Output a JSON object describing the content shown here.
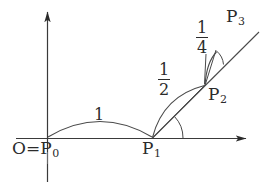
{
  "figure": {
    "type": "geometric-diagram",
    "background_color": "#ffffff",
    "stroke_color": "#2b2b2b",
    "width": 267,
    "height": 194,
    "axes": {
      "x_axis": {
        "from": [
          16,
          138
        ],
        "to": [
          250,
          138
        ],
        "arrow": "right"
      },
      "y_axis": {
        "from": [
          47,
          182
        ],
        "to": [
          47,
          8
        ],
        "arrow": "up"
      }
    },
    "points": [
      {
        "id": "P0",
        "label": "O",
        "sub": "",
        "x": 47,
        "y": 138
      },
      {
        "id": "P1",
        "label": "P",
        "sub": "1",
        "x": 152,
        "y": 138
      },
      {
        "id": "P2",
        "label": "P",
        "sub": "2",
        "x": 205,
        "y": 85
      },
      {
        "id": "P3",
        "label": "P",
        "sub": "3",
        "x": 238,
        "y": 48
      }
    ],
    "labels": {
      "origin": {
        "text_o": "O",
        "equals": "=",
        "text_p": "P",
        "sub": "0",
        "x": 14,
        "y": 148
      },
      "p1": {
        "text": "P",
        "sub": "1",
        "x": 143,
        "y": 147
      },
      "p2": {
        "text": "P",
        "sub": "2",
        "x": 209,
        "y": 90
      },
      "p3": {
        "text": "P",
        "sub": "3",
        "x": 228,
        "y": 12
      }
    },
    "arc_lengths": [
      {
        "id": "arc-1",
        "value": "1",
        "numerator": "",
        "denominator": "",
        "style": "integer",
        "x": 96,
        "y": 113
      },
      {
        "id": "arc-half",
        "numerator": "1",
        "denominator": "2",
        "style": "fraction",
        "x": 161,
        "y": 72
      },
      {
        "id": "arc-quarter",
        "numerator": "1",
        "denominator": "4",
        "style": "fraction",
        "x": 198,
        "y": 28
      }
    ]
  }
}
